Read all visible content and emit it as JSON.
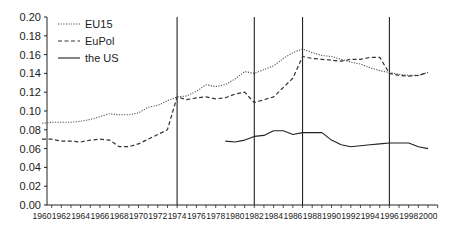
{
  "chart_data": {
    "type": "line",
    "title": "",
    "xlabel": "",
    "ylabel": "",
    "ylim": [
      0.0,
      0.2
    ],
    "xlim": [
      1960,
      2001
    ],
    "grid": false,
    "legend_position": "upper-left",
    "yticks": [
      "0.00",
      "0.02",
      "0.04",
      "0.06",
      "0.08",
      "0.10",
      "0.12",
      "0.14",
      "0.16",
      "0.18",
      "0.20"
    ],
    "xticks": [
      "1960",
      "1962",
      "1964",
      "1966",
      "1968",
      "1970",
      "1972",
      "1974",
      "1976",
      "1978",
      "1980",
      "1982",
      "1984",
      "1986",
      "1988",
      "1990",
      "1992",
      "1994",
      "1996",
      "1998",
      "2000"
    ],
    "vertical_lines": [
      1974,
      1982,
      1987,
      1996
    ],
    "series": [
      {
        "name": "EU15",
        "style": "dotted",
        "x": [
          1960,
          1961,
          1962,
          1963,
          1964,
          1965,
          1966,
          1967,
          1968,
          1969,
          1970,
          1971,
          1972,
          1973,
          1974,
          1975,
          1976,
          1977,
          1978,
          1979,
          1980,
          1981,
          1982,
          1983,
          1984,
          1985,
          1986,
          1987,
          1988,
          1989,
          1990,
          1991,
          1992,
          1993,
          1994,
          1995,
          1996,
          1997,
          1998,
          1999,
          2000
        ],
        "values": [
          0.087,
          0.088,
          0.088,
          0.088,
          0.089,
          0.091,
          0.094,
          0.097,
          0.096,
          0.096,
          0.098,
          0.104,
          0.106,
          0.111,
          0.115,
          0.116,
          0.121,
          0.128,
          0.126,
          0.128,
          0.134,
          0.142,
          0.14,
          0.144,
          0.148,
          0.156,
          0.162,
          0.166,
          0.162,
          0.159,
          0.158,
          0.155,
          0.152,
          0.15,
          0.146,
          0.143,
          0.141,
          0.139,
          0.138,
          0.138,
          0.141
        ]
      },
      {
        "name": "EuPol",
        "style": "dashed",
        "x": [
          1960,
          1961,
          1962,
          1963,
          1964,
          1965,
          1966,
          1967,
          1968,
          1969,
          1970,
          1971,
          1972,
          1973,
          1974,
          1975,
          1976,
          1977,
          1978,
          1979,
          1980,
          1981,
          1982,
          1983,
          1984,
          1985,
          1986,
          1987,
          1988,
          1989,
          1990,
          1991,
          1992,
          1993,
          1994,
          1995,
          1996,
          1997,
          1998,
          1999,
          2000
        ],
        "values": [
          0.07,
          0.07,
          0.068,
          0.068,
          0.067,
          0.069,
          0.07,
          0.069,
          0.062,
          0.062,
          0.065,
          0.07,
          0.075,
          0.08,
          0.115,
          0.112,
          0.114,
          0.115,
          0.113,
          0.114,
          0.118,
          0.12,
          0.109,
          0.112,
          0.115,
          0.125,
          0.135,
          0.158,
          0.156,
          0.155,
          0.154,
          0.153,
          0.155,
          0.155,
          0.157,
          0.157,
          0.14,
          0.138,
          0.137,
          0.138,
          0.141
        ]
      },
      {
        "name": "the US",
        "style": "solid",
        "x": [
          1979,
          1980,
          1981,
          1982,
          1983,
          1984,
          1985,
          1986,
          1987,
          1988,
          1989,
          1990,
          1991,
          1992,
          1993,
          1994,
          1995,
          1996,
          1997,
          1998,
          1999,
          2000
        ],
        "values": [
          0.068,
          0.067,
          0.069,
          0.073,
          0.074,
          0.079,
          0.079,
          0.075,
          0.077,
          0.077,
          0.077,
          0.069,
          0.064,
          0.062,
          0.063,
          0.064,
          0.065,
          0.066,
          0.066,
          0.066,
          0.062,
          0.06
        ]
      }
    ]
  }
}
